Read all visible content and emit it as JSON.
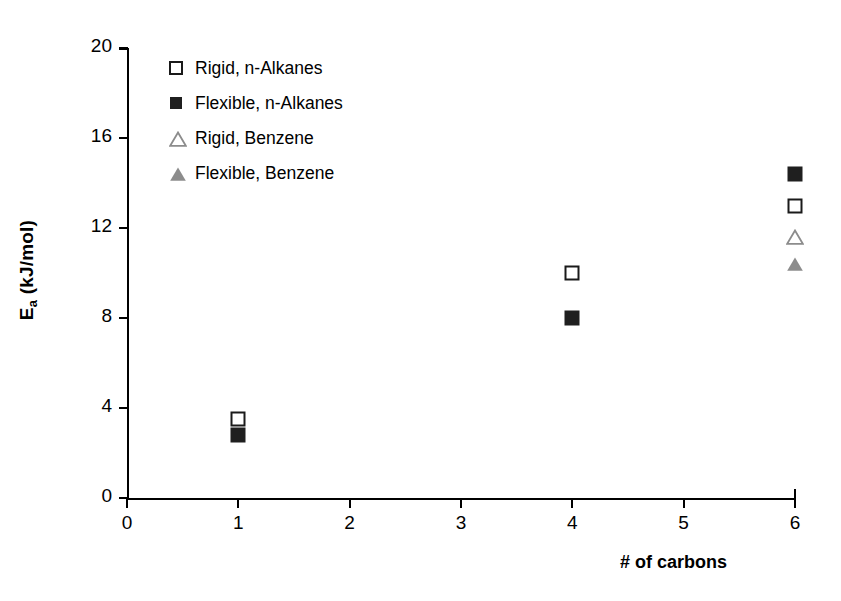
{
  "chart_data": {
    "type": "scatter",
    "title": "",
    "xlabel": "# of carbons",
    "ylabel": "E_a (kJ/mol)",
    "ylabel_base": "E",
    "ylabel_sub": "a",
    "ylabel_unit": " (kJ/mol)",
    "xlim": [
      0,
      6
    ],
    "ylim": [
      0,
      20
    ],
    "xticks": [
      0,
      1,
      2,
      3,
      4,
      5,
      6
    ],
    "yticks": [
      0,
      4,
      8,
      12,
      16,
      20
    ],
    "xtick_labels": [
      "0",
      "1",
      "2",
      "3",
      "4",
      "5",
      "6"
    ],
    "ytick_labels": [
      "0",
      "4",
      "8",
      "12",
      "16",
      "20"
    ],
    "grid": false,
    "legend_position": "upper-left-inside",
    "series": [
      {
        "name": "Rigid, n-Alkanes",
        "marker": "square-open",
        "color": "#1a1a1a",
        "fill": "#ffffff",
        "points": [
          {
            "x": 1,
            "y": 3.5
          },
          {
            "x": 4,
            "y": 10.0
          },
          {
            "x": 6,
            "y": 13.0
          }
        ]
      },
      {
        "name": "Flexible, n-Alkanes",
        "marker": "square-filled",
        "color": "#1f1f1f",
        "fill": "#1f1f1f",
        "points": [
          {
            "x": 1,
            "y": 2.8
          },
          {
            "x": 4,
            "y": 8.0
          },
          {
            "x": 6,
            "y": 14.4
          }
        ]
      },
      {
        "name": "Rigid, Benzene",
        "marker": "triangle-open",
        "color": "#8c8c8c",
        "fill": "#ffffff",
        "points": [
          {
            "x": 6,
            "y": 11.6
          }
        ]
      },
      {
        "name": "Flexible, Benzene",
        "marker": "triangle-filled",
        "color": "#8c8c8c",
        "fill": "#8c8c8c",
        "points": [
          {
            "x": 6,
            "y": 10.4
          }
        ]
      }
    ]
  },
  "legend": {
    "items": [
      {
        "label": "Rigid, n-Alkanes",
        "marker": "square-open"
      },
      {
        "label": "Flexible, n-Alkanes",
        "marker": "square-filled"
      },
      {
        "label": "Rigid, Benzene",
        "marker": "triangle-open"
      },
      {
        "label": "Flexible, Benzene",
        "marker": "triangle-filled"
      }
    ]
  },
  "colors": {
    "axis": "#000000",
    "black_marker": "#1f1f1f",
    "gray_marker": "#8c8c8c",
    "background": "#ffffff"
  }
}
